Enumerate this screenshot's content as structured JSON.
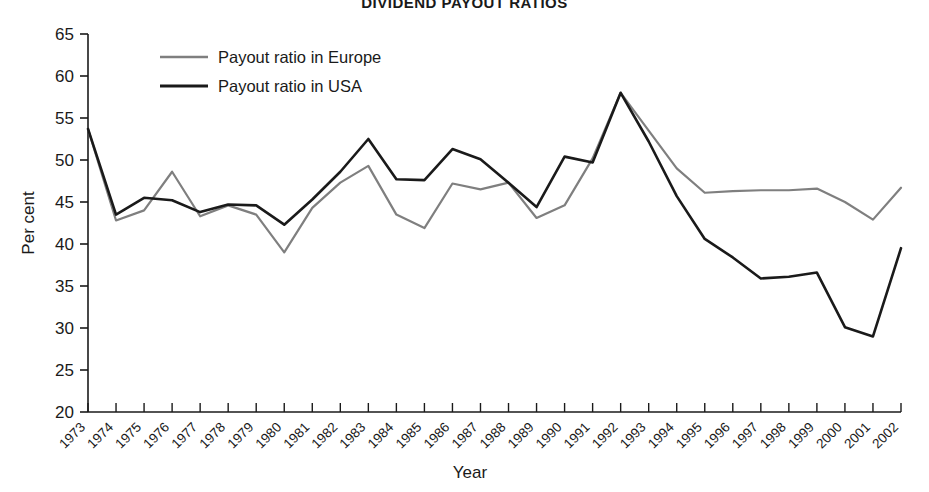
{
  "chart_data": {
    "type": "line",
    "title": "DIVIDEND PAYOUT RATIOS",
    "xlabel": "Year",
    "ylabel": "Per cent",
    "ylim": [
      20,
      65
    ],
    "yticks": [
      20,
      25,
      30,
      35,
      40,
      45,
      50,
      55,
      60,
      65
    ],
    "grid": false,
    "legend_position": "top-left-inside",
    "categories": [
      "1973",
      "1974",
      "1975",
      "1976",
      "1977",
      "1978",
      "1979",
      "1980",
      "1981",
      "1982",
      "1983",
      "1984",
      "1985",
      "1986",
      "1987",
      "1988",
      "1989",
      "1990",
      "1991",
      "1992",
      "1993",
      "1994",
      "1995",
      "1996",
      "1997",
      "1998",
      "1999",
      "2000",
      "2001",
      "2002"
    ],
    "series": [
      {
        "name": "Payout ratio in Europe",
        "color": "#7f7f7f",
        "values": [
          53.7,
          42.8,
          44.0,
          48.6,
          43.3,
          44.6,
          43.5,
          39.0,
          44.3,
          47.3,
          49.3,
          43.5,
          41.9,
          47.2,
          46.5,
          47.3,
          43.1,
          44.6,
          50.2,
          58.0,
          53.5,
          49.0,
          46.1,
          46.3,
          46.4,
          46.4,
          46.6,
          45.0,
          42.9,
          46.7
        ]
      },
      {
        "name": "Payout ratio in USA",
        "color": "#1a1a1a",
        "values": [
          53.7,
          43.5,
          45.5,
          45.2,
          43.8,
          44.7,
          44.6,
          42.3,
          45.3,
          48.6,
          52.5,
          47.7,
          47.6,
          51.3,
          50.1,
          47.3,
          44.4,
          50.4,
          49.7,
          58.0,
          52.2,
          45.7,
          40.6,
          38.4,
          35.9,
          36.1,
          36.6,
          30.1,
          29.0,
          39.5
        ]
      }
    ]
  },
  "legend": {
    "items": [
      {
        "label": "Payout ratio in Europe",
        "color": "#7f7f7f"
      },
      {
        "label": "Payout ratio in USA",
        "color": "#1a1a1a"
      }
    ]
  }
}
